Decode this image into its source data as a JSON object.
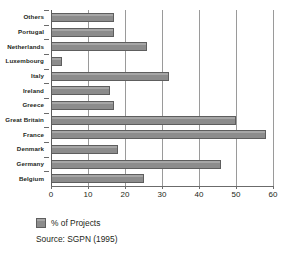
{
  "chart_data": {
    "type": "bar",
    "orientation": "horizontal",
    "title": "",
    "xlabel": "",
    "ylabel": "",
    "categories": [
      "Others",
      "Portugal",
      "Netherlands",
      "Luxembourg",
      "Italy",
      "Ireland",
      "Greece",
      "Great Britain",
      "France",
      "Denmark",
      "Germany",
      "Belgium"
    ],
    "values": [
      17,
      17,
      26,
      3,
      32,
      16,
      17,
      50,
      58,
      18,
      46,
      25
    ],
    "series": [
      {
        "name": "% of Projects",
        "values": [
          17,
          17,
          26,
          3,
          32,
          16,
          17,
          50,
          58,
          18,
          46,
          25
        ]
      }
    ],
    "xlim": [
      0,
      60
    ],
    "xticks": [
      0,
      10,
      20,
      30,
      40,
      50,
      60
    ],
    "xtick_labels": [
      "0",
      "10",
      "20",
      "30",
      "40",
      "50",
      "60"
    ],
    "grid": "vertical",
    "legend": {
      "position": "bottom-left",
      "entries": [
        {
          "label": "% of Projects",
          "color": "#8c8c8c"
        }
      ]
    },
    "annotations": [
      {
        "name": "source-note",
        "text": "Source: SGPN (1995)"
      }
    ],
    "colors": {
      "bar_fill": "#8c8c8c",
      "bar_stroke": "#5e5e5e",
      "gridline": "#9a9a9a",
      "axis": "#6b6b6b",
      "text": "#231f20",
      "background": "#ffffff"
    }
  },
  "source_note": "Source: SGPN (1995)"
}
